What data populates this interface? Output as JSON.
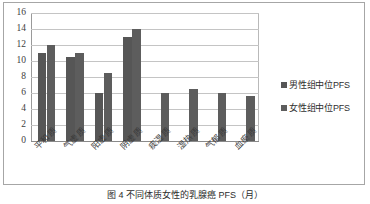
{
  "chart_data": {
    "type": "bar",
    "title": "",
    "xlabel": "",
    "ylabel": "",
    "ylim": [
      0,
      16
    ],
    "ytick_step": 2,
    "yticks": [
      "16",
      "14",
      "12",
      "10",
      "8",
      "6",
      "4",
      "2",
      "0"
    ],
    "grid": true,
    "legend_position": "right",
    "categories": [
      "平和质",
      "气虚质",
      "阳虚质",
      "阴虚质",
      "痰湿质",
      "湿热质",
      "气郁质",
      "血瘀质"
    ],
    "series": [
      {
        "name": "男性组中位PFS",
        "color": "#565656",
        "values": [
          11.0,
          10.5,
          6.0,
          13.0,
          null,
          null,
          null,
          null
        ]
      },
      {
        "name": "女性组中位PFS",
        "color": "#5d5d5d",
        "values": [
          12.0,
          11.0,
          8.5,
          14.0,
          6.0,
          6.5,
          6.0,
          5.6
        ]
      }
    ]
  },
  "legend": {
    "items": [
      {
        "label": "男性组中位PFS",
        "color": "#565656"
      },
      {
        "label": "女性组中位PFS",
        "color": "#5d5d5d"
      }
    ]
  },
  "caption": {
    "text": "图 4  不同体质女性的乳腺癌 PFS（月）"
  },
  "colors": {
    "bar_male": "#565656",
    "bar_female": "#5d5d5d",
    "grid": "#c4c4c4",
    "axis": "#9a9a9a",
    "border": "#a6a6a6",
    "text": "#3b3b3b"
  }
}
